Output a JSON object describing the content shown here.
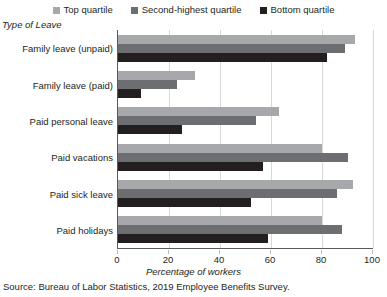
{
  "chart_data": {
    "type": "bar",
    "orientation": "horizontal",
    "title": "",
    "xlabel": "Percentage of workers",
    "ylabel": "Type of Leave",
    "categories": [
      "Family leave (unpaid)",
      "Family leave (paid)",
      "Paid personal leave",
      "Paid vacations",
      "Paid sick leave",
      "Paid holidays"
    ],
    "series": [
      {
        "name": "Top quartile",
        "color": "#a6a8ab",
        "values": [
          93,
          30,
          63,
          80,
          92,
          80
        ]
      },
      {
        "name": "Second-highest quartile",
        "color": "#6d6e71",
        "values": [
          89,
          23,
          54,
          90,
          86,
          88
        ]
      },
      {
        "name": "Bottom quartile",
        "color": "#231f20",
        "values": [
          82,
          9,
          25,
          57,
          52,
          59
        ]
      }
    ],
    "xlim": [
      0,
      100
    ],
    "xticks": [
      0,
      20,
      40,
      60,
      80,
      100
    ],
    "xtick_labels": [
      "0",
      "20",
      "40",
      "60",
      "80",
      "100"
    ],
    "grid": "vertical",
    "legend_position": "top-center"
  },
  "legend": {
    "items": [
      {
        "label": "Top quartile",
        "swatch": "#a6a8ab"
      },
      {
        "label": "Second-highest quartile",
        "swatch": "#6d6e71"
      },
      {
        "label": "Bottom quartile",
        "swatch": "#231f20"
      }
    ]
  },
  "footer": {
    "source": "Source: Bureau of Labor Statistics, 2019 Employee Benefits Survey."
  }
}
